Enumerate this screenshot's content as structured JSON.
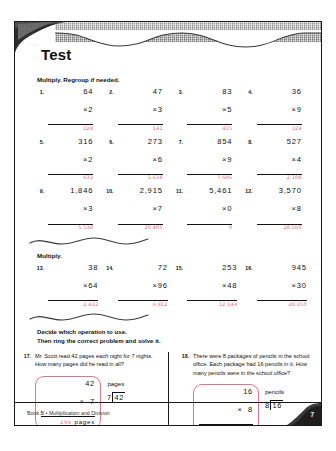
{
  "document": {
    "title": "Test",
    "footer_text": "Book B • Multiplication and Division",
    "page_number": "7"
  },
  "sections": [
    {
      "heading": "Multiply. Regroup if needed.",
      "rows": [
        [
          {
            "num": "1.",
            "top": "64",
            "operator": "×",
            "bottom": "2",
            "answer": "128"
          },
          {
            "num": "2.",
            "top": "47",
            "operator": "×",
            "bottom": "3",
            "answer": "141"
          },
          {
            "num": "3.",
            "top": "83",
            "operator": "×",
            "bottom": "5",
            "answer": "415"
          },
          {
            "num": "4.",
            "top": "36",
            "operator": "×",
            "bottom": "9",
            "answer": "324"
          }
        ],
        [
          {
            "num": "5.",
            "top": "316",
            "operator": "×",
            "bottom": "2",
            "answer": "632"
          },
          {
            "num": "6.",
            "top": "273",
            "operator": "×",
            "bottom": "6",
            "answer": "1,638"
          },
          {
            "num": "7.",
            "top": "854",
            "operator": "×",
            "bottom": "9",
            "answer": "7,686"
          },
          {
            "num": "8.",
            "top": "527",
            "operator": "×",
            "bottom": "4",
            "answer": "2,108"
          }
        ],
        [
          {
            "num": "9.",
            "top": "1,846",
            "operator": "×",
            "bottom": "3",
            "answer": "5,538"
          },
          {
            "num": "10.",
            "top": "2,915",
            "operator": "×",
            "bottom": "7",
            "answer": "20,405"
          },
          {
            "num": "11.",
            "top": "5,461",
            "operator": "×",
            "bottom": "0",
            "answer": "0"
          },
          {
            "num": "12.",
            "top": "3,570",
            "operator": "×",
            "bottom": "8",
            "answer": "28,560"
          }
        ]
      ]
    },
    {
      "heading": "Multiply.",
      "rows": [
        [
          {
            "num": "13.",
            "top": "38",
            "operator": "×",
            "bottom": "64",
            "answer": "2,432"
          },
          {
            "num": "14.",
            "top": "72",
            "operator": "×",
            "bottom": "96",
            "answer": "6,912"
          },
          {
            "num": "15.",
            "top": "253",
            "operator": "×",
            "bottom": "48",
            "answer": "12,144"
          },
          {
            "num": "16.",
            "top": "945",
            "operator": "×",
            "bottom": "30",
            "answer": "28,350"
          }
        ]
      ]
    }
  ],
  "word_problems": {
    "instructions_line1": "Decide which operation to use.",
    "instructions_line2": "Then ring the correct problem and solve it.",
    "items": [
      {
        "num": "17.",
        "text": "Mr. Scott read 42 pages each night for 7 nights. How many pages did he read in all?",
        "multiplication": {
          "top": "42",
          "operator": "×",
          "bottom": "7",
          "answer": "294",
          "unit": "pages"
        },
        "division": {
          "divisor": "7",
          "dividend": "42",
          "unit": "pages"
        },
        "selected": "multiplication"
      },
      {
        "num": "18.",
        "text": "There were 8 packages of pencils in the school office. Each package had 16 pencils in it. How many pencils were in the school office?",
        "multiplication": {
          "top": "16",
          "operator": "×",
          "bottom": "8",
          "answer": "128",
          "unit": "pencils"
        },
        "division": {
          "divisor": "8",
          "dividend": "16",
          "unit": "pencils"
        },
        "selected": "multiplication"
      }
    ]
  },
  "colors": {
    "answer_ink": "#e0607f",
    "circle_ink": "#e8708c",
    "rule": "#111111"
  }
}
